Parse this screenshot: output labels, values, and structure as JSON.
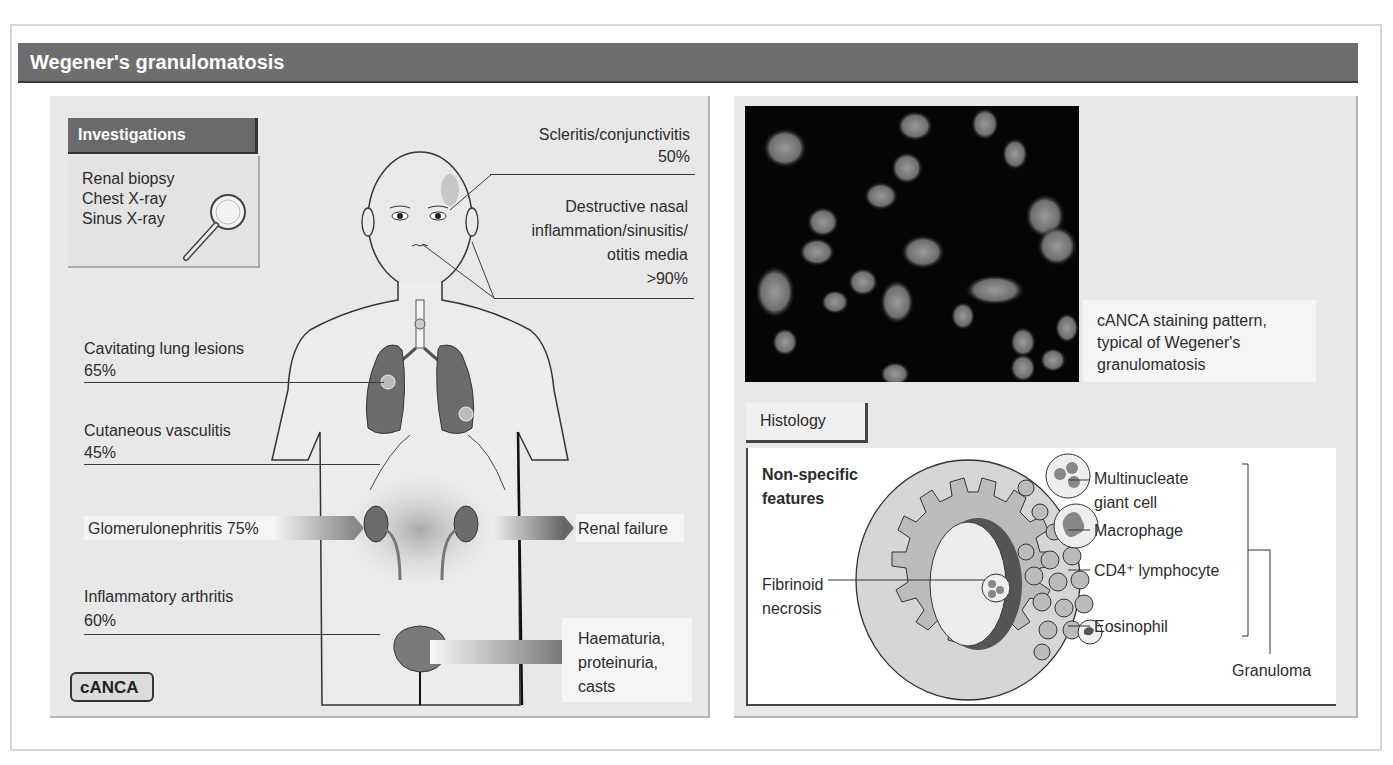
{
  "title": "Wegener's granulomatosis",
  "investigations": {
    "heading": "Investigations",
    "items": [
      "Renal biopsy",
      "Chest X-ray",
      "Sinus X-ray"
    ],
    "icon": "magnifying-glass-icon"
  },
  "features": {
    "scleritis": {
      "label": "Scleritis/conjunctivitis",
      "value": "50%"
    },
    "nasal": {
      "line1": "Destructive nasal",
      "line2": "inflammation/sinusitis/",
      "line3": "otitis media",
      "value": ">90%"
    },
    "lung": {
      "label": "Cavitating lung lesions",
      "value": "65%"
    },
    "skin": {
      "label": "Cutaneous vasculitis",
      "value": "45%"
    },
    "kidney": {
      "label": "Glomerulonephritis 75%"
    },
    "joint": {
      "label": "Inflammatory arthritis",
      "value": "60%"
    }
  },
  "outcomes": {
    "renal_failure": "Renal failure",
    "urine": {
      "line1": "Haematuria,",
      "line2": "proteinuria,",
      "line3": "casts"
    }
  },
  "badge": "cANCA",
  "staining_caption": {
    "line1": "cANCA staining pattern,",
    "line2": "typical of Wegener's",
    "line3": "granulomatosis"
  },
  "histology": {
    "tab": "Histology",
    "nonspecific": {
      "line1": "Non-specific",
      "line2": "features"
    },
    "fibrinoid": {
      "line1": "Fibrinoid",
      "line2": "necrosis"
    },
    "cells": {
      "giant1": "Multinucleate",
      "giant2": "giant cell",
      "macrophage": "Macrophage",
      "lymphocyte": "CD4⁺ lymphocyte",
      "eosinophil": "Eosinophil"
    },
    "granuloma": "Granuloma"
  },
  "colors": {
    "header": "#6e6e6e",
    "panel": "#e8e8e8",
    "organ": "#6b6b6b"
  }
}
